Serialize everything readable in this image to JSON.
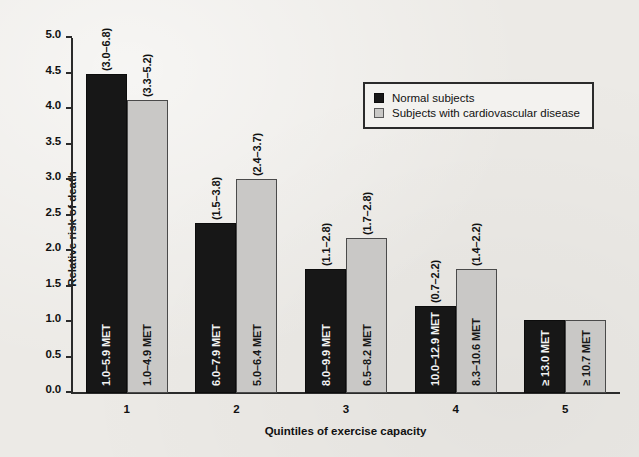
{
  "chart_data": {
    "type": "bar",
    "title": "",
    "xlabel": "Quintiles of exercise capacity",
    "ylabel": "Relative risk of death",
    "ylim": [
      0.0,
      5.0
    ],
    "ytick_step": 0.5,
    "grid": false,
    "legend_position": "top-right",
    "categories": [
      "1",
      "2",
      "3",
      "4",
      "5"
    ],
    "yticks": [
      "0.0",
      "0.5",
      "1.0",
      "1.5",
      "2.0",
      "2.5",
      "3.0",
      "3.5",
      "4.0",
      "4.5",
      "5.0"
    ],
    "series": [
      {
        "name": "Normal subjects",
        "color": "#171717",
        "values": [
          4.5,
          2.4,
          1.75,
          1.23,
          1.03
        ],
        "bar_labels": [
          "1.0–5.9 MET",
          "6.0–7.9 MET",
          "8.0–9.9 MET",
          "10.0–12.9 MET",
          "≥ 13.0 MET"
        ],
        "ci_labels": [
          "(3.0–6.8)",
          "(1.5–3.8)",
          "(1.1–2.8)",
          "(0.7–2.2)",
          ""
        ]
      },
      {
        "name": "Subjects with cardiovascular disease",
        "color": "#c9c8c6",
        "values": [
          4.13,
          3.01,
          2.18,
          1.75,
          1.03
        ],
        "bar_labels": [
          "1.0–4.9 MET",
          "5.0–6.4 MET",
          "6.5–8.2 MET",
          "8.3–10.6 MET",
          "≥ 10.7 MET"
        ],
        "ci_labels": [
          "(3.3–5.2)",
          "(2.4–3.7)",
          "(1.7–2.8)",
          "(1.4–2.2)",
          ""
        ]
      }
    ]
  },
  "legend": {
    "items": [
      {
        "label": "Normal subjects",
        "color": "#171717"
      },
      {
        "label": "Subjects with cardiovascular disease",
        "color": "#c9c8c6"
      }
    ]
  }
}
